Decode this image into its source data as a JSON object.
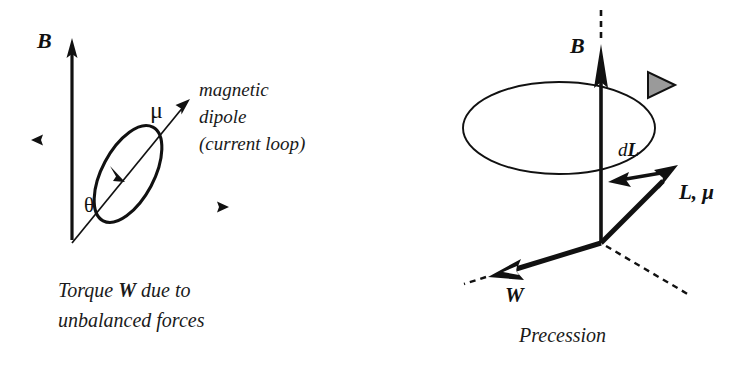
{
  "figure": {
    "background_color": "#ffffff",
    "ink_color": "#111111",
    "accent_gray": "#9a9a9a",
    "width": 748,
    "height": 375
  },
  "left_panel": {
    "name": "magnetic-dipole-torque-diagram",
    "labels": {
      "field_vector": "B",
      "dipole_vector": "μ",
      "angle": "θ"
    },
    "annotation_lines": [
      "magnetic",
      "dipole",
      "(current loop)"
    ],
    "caption_line1_prefix": "Torque ",
    "caption_line1_bold": "W",
    "caption_line1_suffix": " due to",
    "caption_line2": "unbalanced forces"
  },
  "right_panel": {
    "name": "precession-diagram",
    "labels": {
      "field_vector": "B",
      "torque_vector": "W",
      "angular_momentum": "L, μ",
      "momentum_change_italic": "d",
      "momentum_change_bold": "L"
    },
    "caption": "Precession"
  }
}
